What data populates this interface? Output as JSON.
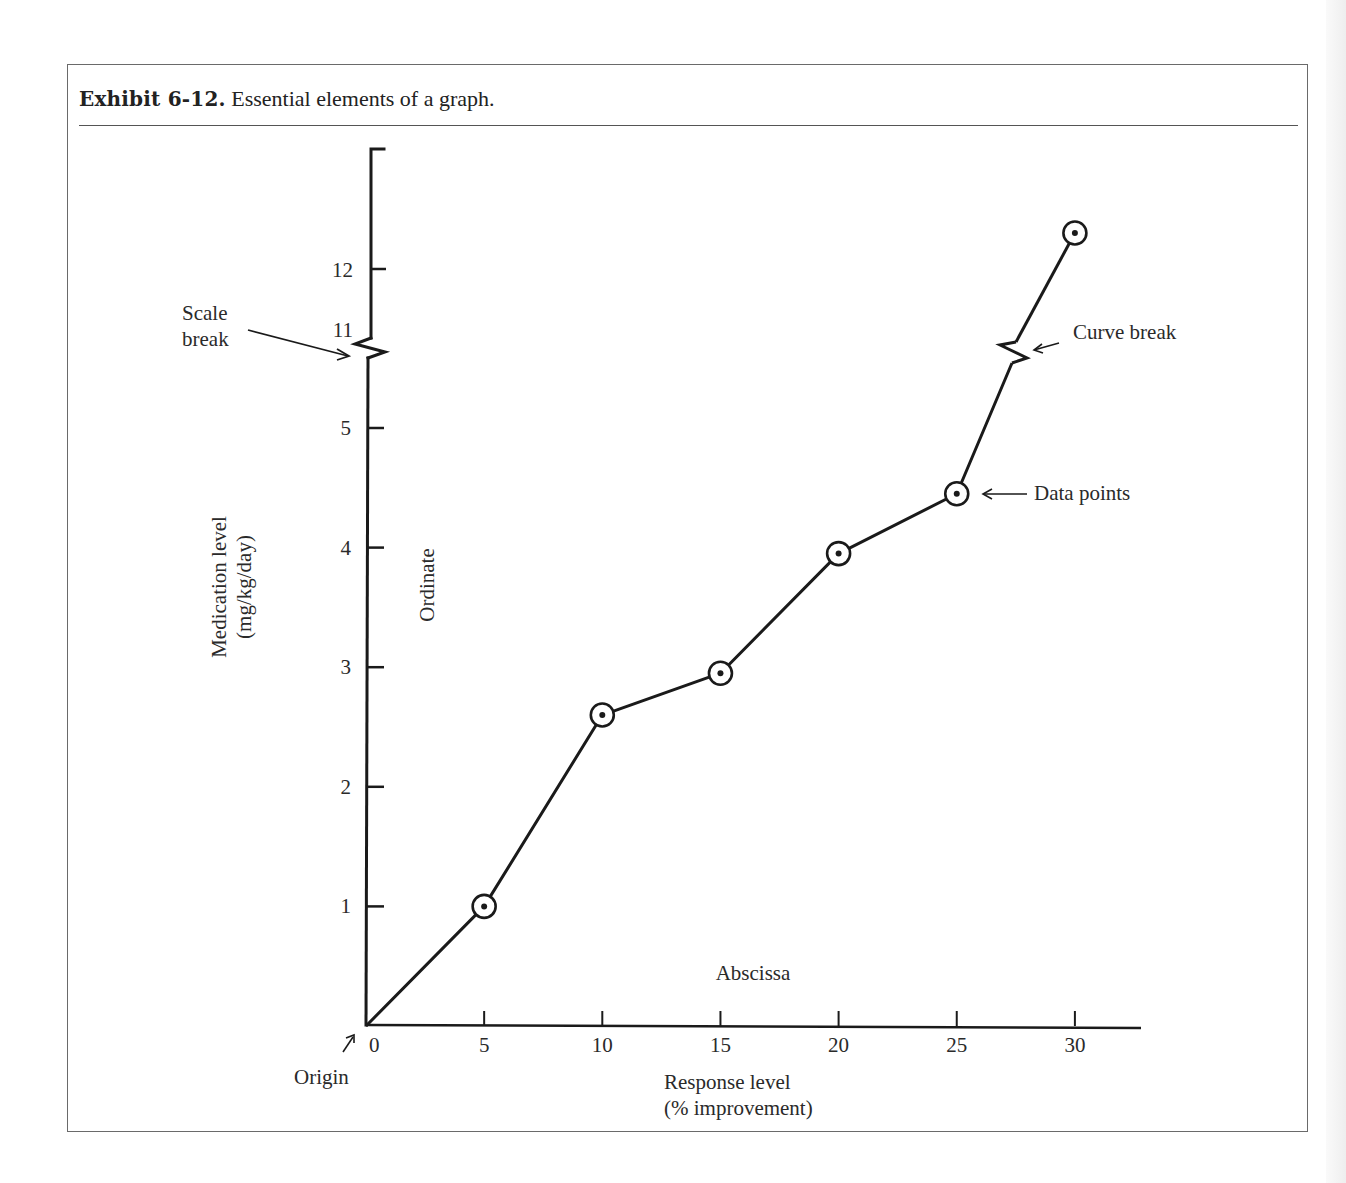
{
  "exhibit": {
    "label": "Exhibit 6-12.",
    "caption": "Essential elements of a graph."
  },
  "annotations": {
    "scale_break_line1": "Scale",
    "scale_break_line2": "break",
    "curve_break": "Curve break",
    "data_points": "Data points",
    "ordinate": "Ordinate",
    "abscissa": "Abscissa",
    "origin": "Origin"
  },
  "colors": {
    "ink": "#1a1a1a",
    "frame": "#6a6a6a",
    "background": "#ffffff"
  },
  "chart_data": {
    "type": "line",
    "title": "Essential elements of a graph",
    "xlabel": "Response level (% improvement)",
    "xlabel_line1": "Response level",
    "xlabel_line2": "(% improvement)",
    "ylabel": "Medication level (mg/kg/day)",
    "ylabel_line1": "Medication level",
    "ylabel_line2": "(mg/kg/day)",
    "x_ticks": [
      0,
      5,
      10,
      15,
      20,
      25,
      30
    ],
    "x_tick_labels": [
      "0",
      "5",
      "10",
      "15",
      "20",
      "25",
      "30"
    ],
    "y_ticks_lower": [
      1,
      2,
      3,
      4,
      5
    ],
    "y_tick_labels_lower": [
      "1",
      "2",
      "3",
      "4",
      "5"
    ],
    "y_ticks_upper": [
      11,
      12
    ],
    "y_tick_labels_upper": [
      "11",
      "12"
    ],
    "scale_break_between": [
      5,
      11
    ],
    "xlim": [
      0,
      33
    ],
    "grid": false,
    "legend": null,
    "series": [
      {
        "name": "Medication level",
        "marker": "circled-dot",
        "x": [
          0,
          5,
          10,
          15,
          20,
          25,
          30
        ],
        "y": [
          0,
          1.0,
          2.6,
          2.95,
          3.95,
          4.45,
          12.6
        ],
        "marker_on": [
          false,
          true,
          true,
          true,
          true,
          true,
          true
        ],
        "curve_break_between_index": [
          5,
          6
        ]
      }
    ]
  }
}
